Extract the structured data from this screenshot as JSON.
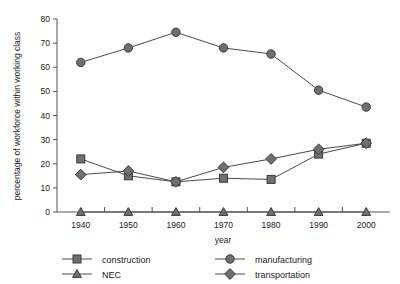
{
  "chart_data": {
    "type": "line",
    "title": "",
    "xlabel": "year",
    "ylabel": "percentage of workforce within working class",
    "x": [
      1940,
      1950,
      1960,
      1970,
      1980,
      1990,
      2000
    ],
    "xtick_labels": [
      "1940",
      "1950",
      "1960",
      "1970",
      "1980",
      "1990",
      "2000"
    ],
    "xlim": [
      1935,
      2005
    ],
    "ylim": [
      0,
      80
    ],
    "ytick_labels": [
      "0",
      "10",
      "20",
      "30",
      "40",
      "50",
      "60",
      "70",
      "80"
    ],
    "yticks": [
      0,
      10,
      20,
      30,
      40,
      50,
      60,
      70,
      80
    ],
    "grid": false,
    "minor_xticks": [
      1945,
      1955,
      1965,
      1975,
      1985,
      1995
    ],
    "legend_position": "below-plot",
    "series": [
      {
        "name": "construction",
        "marker": "square",
        "values": [
          22,
          15,
          12.5,
          14,
          13.5,
          24,
          28.5
        ]
      },
      {
        "name": "NEC",
        "marker": "triangle",
        "values": [
          0,
          0,
          0,
          0,
          0,
          0,
          0
        ]
      },
      {
        "name": "manufacturing",
        "marker": "circle",
        "values": [
          62,
          68,
          74.5,
          68,
          65.5,
          50.5,
          43.5
        ]
      },
      {
        "name": "transportation",
        "marker": "diamond",
        "values": [
          15.5,
          17,
          12.5,
          18.5,
          22,
          26,
          28.5
        ]
      }
    ],
    "colors": {
      "marker_fill": "#6f6f6f",
      "marker_stroke": "#3a3a3a",
      "line": "#4a4a4a",
      "axis": "#555555",
      "text": "#1a1a1a",
      "background": "#ffffff"
    }
  },
  "axes": {
    "y_title": "percentage of workforce within working class",
    "x_title": "year"
  },
  "legend": {
    "entries": [
      {
        "label": "construction",
        "marker": "square"
      },
      {
        "label": "NEC",
        "marker": "triangle"
      },
      {
        "label": "manufacturing",
        "marker": "circle"
      },
      {
        "label": "transportation",
        "marker": "diamond"
      }
    ]
  }
}
